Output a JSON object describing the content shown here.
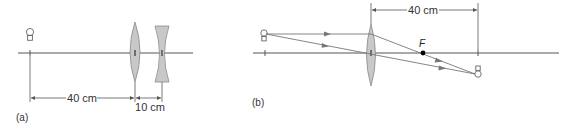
{
  "colors": {
    "axis": "#555555",
    "lens_fill": "#c8c8c8",
    "lens_stroke": "#8a8a8a",
    "ray": "#777777",
    "focal_point": "#000000",
    "text": "#333333"
  },
  "panel_a": {
    "caption": "(a)",
    "object": "light-bulb",
    "lenses": [
      "converging lens",
      "diverging lens"
    ],
    "dimensions": {
      "object_to_lens1": "40 cm",
      "lens1_to_lens2": "10 cm"
    }
  },
  "panel_b": {
    "caption": "(b)",
    "object": "light-bulb",
    "image": "inverted light-bulb",
    "focal_label": "F",
    "lens": "converging lens",
    "dimensions": {
      "lens_to_image": "40 cm"
    }
  }
}
